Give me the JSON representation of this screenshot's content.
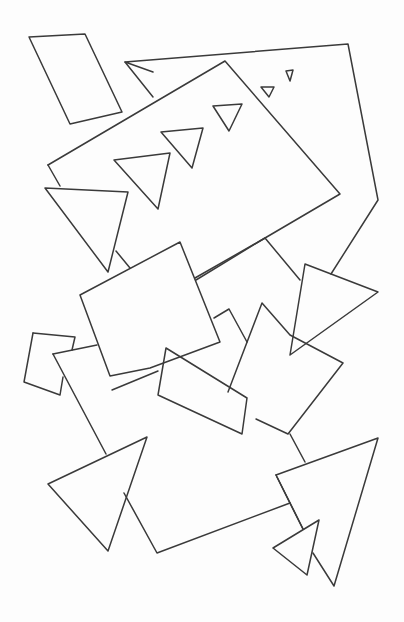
{
  "drawing": {
    "background": "#fdfdfd",
    "stroke": "#3a3a3a",
    "shapes": [
      {
        "name": "small-rectangle-top-left",
        "points": "29,37 85,34 122,112 70,124 29,37"
      },
      {
        "name": "large-pentagon-back",
        "points": "153,72 125,62 348,44 378,200 331,274"
      },
      {
        "name": "large-pentagon-back-left-edge",
        "points": "125,62 153,97"
      },
      {
        "name": "tilted-square-main",
        "points": "48,165 225,61 340,194 265,238 195,278"
      },
      {
        "name": "tilted-square-main-left",
        "points": "48,165 60,186"
      },
      {
        "name": "tilted-square-main-lower-left",
        "points": "116,251 130,268"
      },
      {
        "name": "triangle-tiny-1",
        "points": "286,71 293,70 290,81 286,71"
      },
      {
        "name": "triangle-tiny-2",
        "points": "261,87 274,87 269,97 261,87"
      },
      {
        "name": "triangle-small-3",
        "points": "213,106 242,104 229,131 213,106"
      },
      {
        "name": "triangle-small-4",
        "points": "161,132 203,128 192,168 161,132"
      },
      {
        "name": "triangle-medium-5",
        "points": "114,160 170,153 158,209 114,160"
      },
      {
        "name": "triangle-left-large",
        "points": "45,188 128,192 108,272 45,188"
      },
      {
        "name": "square-center-left",
        "points": "80,295 180,242 220,342 150,368 110,376 80,295"
      },
      {
        "name": "square-center-right-top",
        "points": "196,280 265,238 300,280"
      },
      {
        "name": "square-center-right-mid",
        "points": "214,318 229,309 247,342"
      },
      {
        "name": "triangle-right-large",
        "points": "305,264 378,292 290,355 305,264"
      },
      {
        "name": "tilted-square-right",
        "points": "228,392 262,303 290,335 343,363 288,434 256,419"
      },
      {
        "name": "small-pentagon-left",
        "points": "33,333 75,337 72,350"
      },
      {
        "name": "small-pentagon-left-body",
        "points": "33,333 24,382 60,395 63,377"
      },
      {
        "name": "large-square-bottom",
        "points": "53,354 97,345"
      },
      {
        "name": "large-square-bottom-left",
        "points": "53,354 106,454"
      },
      {
        "name": "large-square-bottom-body",
        "points": "124,493 157,553 290,503"
      },
      {
        "name": "large-square-bottom-right",
        "points": "290,434 305,462"
      },
      {
        "name": "large-square-bottom-right-lower",
        "points": "277,477 303,529"
      },
      {
        "name": "rectangle-tilted-center",
        "points": "166,348 247,398 242,434 158,395 166,348"
      },
      {
        "name": "rectangle-tilted-center-left",
        "points": "158,371 112,390"
      },
      {
        "name": "triangle-bottom-left",
        "points": "48,484 147,437 108,551 48,484"
      },
      {
        "name": "triangle-bottom-right-large",
        "points": "276,475 378,438 334,586 313,553"
      },
      {
        "name": "triangle-bottom-right-large-left",
        "points": "276,475 303,529"
      },
      {
        "name": "triangle-bottom-right-small",
        "points": "273,548 319,520 307,575 273,548"
      }
    ]
  }
}
